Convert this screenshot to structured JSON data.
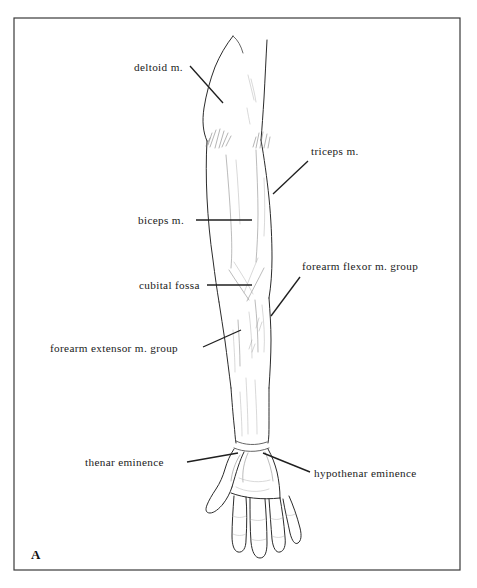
{
  "figure": {
    "panel_letter": "A",
    "caption_region": "anterior view of right upper limb surface anatomy",
    "background_color": "#ffffff",
    "line_color": "#2b2b2b",
    "text_color": "#1a1a1a",
    "frame": {
      "x": 14,
      "y": 18,
      "width": 446,
      "height": 552,
      "border_color": "#3a3a3a"
    }
  },
  "labels": [
    {
      "id": "deltoid",
      "text": "deltoid m.",
      "text_x": 134,
      "text_y": 71,
      "anchor": "start",
      "leader": {
        "x1": 190,
        "y1": 66,
        "x2": 223,
        "y2": 103
      }
    },
    {
      "id": "triceps",
      "text": "triceps m.",
      "text_x": 311,
      "text_y": 155,
      "anchor": "start",
      "leader": {
        "x1": 308,
        "y1": 161,
        "x2": 273,
        "y2": 194
      }
    },
    {
      "id": "biceps",
      "text": "biceps m.",
      "text_x": 138,
      "text_y": 224,
      "anchor": "start",
      "leader": {
        "x1": 196,
        "y1": 220,
        "x2": 252,
        "y2": 220
      }
    },
    {
      "id": "forearm-flexor",
      "text": "forearm flexor m. group",
      "text_x": 302,
      "text_y": 270,
      "anchor": "start",
      "leader": {
        "x1": 300,
        "y1": 277,
        "x2": 271,
        "y2": 316
      }
    },
    {
      "id": "cubital-fossa",
      "text": "cubital fossa",
      "text_x": 139,
      "text_y": 289,
      "anchor": "start",
      "leader": {
        "x1": 207,
        "y1": 285,
        "x2": 252,
        "y2": 285
      }
    },
    {
      "id": "forearm-extensor",
      "text": "forearm extensor m. group",
      "text_x": 50,
      "text_y": 352,
      "anchor": "start",
      "leader": {
        "x1": 203,
        "y1": 347,
        "x2": 241,
        "y2": 330
      }
    },
    {
      "id": "thenar-eminence",
      "text": "thenar eminence",
      "text_x": 85,
      "text_y": 466,
      "anchor": "start",
      "leader": {
        "x1": 187,
        "y1": 462,
        "x2": 238,
        "y2": 453
      }
    },
    {
      "id": "hypothenar-eminence",
      "text": "hypothenar eminence",
      "text_x": 314,
      "text_y": 477,
      "anchor": "start",
      "leader": {
        "x1": 310,
        "y1": 472,
        "x2": 263,
        "y2": 453
      }
    }
  ]
}
